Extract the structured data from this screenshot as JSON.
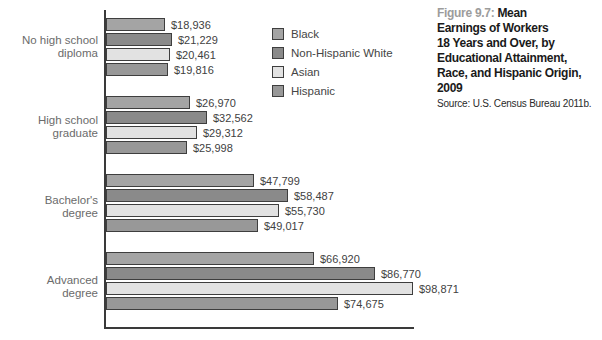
{
  "title": {
    "figure_label": "Figure 9.7: ",
    "text": "Mean\nEarnings of Workers\n18 Years and Over, by\nEducational Attainment,\nRace, and Hispanic Origin,\n2009",
    "source": "Source: U.S. Census Bureau 2011b."
  },
  "chart_data": {
    "type": "bar",
    "orientation": "horizontal",
    "title": "Figure 9.7: Mean Earnings of Workers 18 Years and Over, by Educational Attainment, Race, and Hispanic Origin, 2009",
    "xlabel": "",
    "ylabel": "",
    "grid": false,
    "legend_position": "top-inside",
    "xlim": [
      0,
      98871
    ],
    "plot_width_px": 307,
    "categories": [
      "No high school\ndiploma",
      "High school\ngraduate",
      "Bachelor's\ndegree",
      "Advanced\ndegree"
    ],
    "series": [
      {
        "name": "Black",
        "color": "#a4a4a4",
        "values": [
          18936,
          26970,
          47799,
          66920
        ]
      },
      {
        "name": "Non-Hispanic White",
        "color": "#8a8a8a",
        "values": [
          21229,
          32562,
          58487,
          86770
        ]
      },
      {
        "name": "Asian",
        "color": "#e2e2e2",
        "values": [
          20461,
          29312,
          55730,
          98871
        ]
      },
      {
        "name": "Hispanic",
        "color": "#989898",
        "values": [
          19816,
          25998,
          49017,
          74675
        ]
      }
    ],
    "value_labels": [
      [
        "$18,936",
        "$26,970",
        "$47,799",
        "$66,920"
      ],
      [
        "$21,229",
        "$32,562",
        "$58,487",
        "$86,770"
      ],
      [
        "$20,461",
        "$29,312",
        "$55,730",
        "$98,871"
      ],
      [
        "$19,816",
        "$25,998",
        "$49,017",
        "$74,675"
      ]
    ],
    "colors": {
      "axis": "#3a3a3a",
      "bar_border": "#3e3e3e",
      "value_text": "#414141",
      "category_text": "#6b6b6b",
      "figure_label": "#9c9c9c",
      "title_text": "#1a1a1a"
    }
  }
}
